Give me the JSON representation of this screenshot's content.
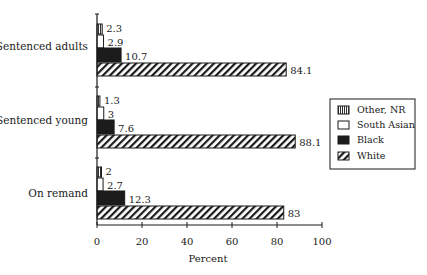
{
  "chart_data": {
    "type": "bar",
    "orientation": "horizontal",
    "title": "",
    "xlabel": "Percent",
    "ylabel": "",
    "xlim": [
      0,
      100
    ],
    "xticks": [
      0,
      20,
      40,
      60,
      80,
      100
    ],
    "grid": false,
    "legend_position": "right",
    "categories": [
      "Sentenced adults",
      "Sentenced young",
      "On remand"
    ],
    "series": [
      {
        "name": "Other, NR",
        "pattern": "vertical-stripes",
        "values": [
          2.3,
          1.3,
          2
        ]
      },
      {
        "name": "South Asian",
        "pattern": "white",
        "values": [
          2.9,
          3,
          2.7
        ]
      },
      {
        "name": "Black",
        "pattern": "solid-black",
        "values": [
          10.7,
          7.6,
          12.3
        ]
      },
      {
        "name": "White",
        "pattern": "diagonal-hatch",
        "values": [
          84.1,
          88.1,
          83
        ]
      }
    ],
    "value_labels": [
      [
        "2.3",
        "2.9",
        "10.7",
        "84.1"
      ],
      [
        "1.3",
        "3",
        "7.6",
        "88.1"
      ],
      [
        "2",
        "2.7",
        "12.3",
        "83"
      ]
    ]
  },
  "legend": {
    "items": [
      {
        "label": "Other, NR"
      },
      {
        "label": "South Asian"
      },
      {
        "label": "Black"
      },
      {
        "label": "White"
      }
    ]
  },
  "colors": {
    "ink": "#1a1a1a",
    "black_bar": "#1c1c1c",
    "background": "#ffffff"
  }
}
